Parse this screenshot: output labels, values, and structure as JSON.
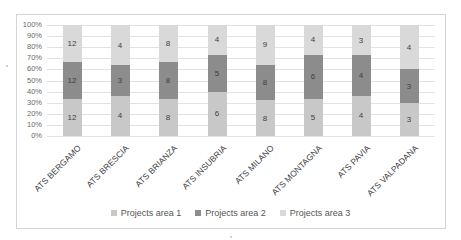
{
  "chart_data": {
    "type": "bar",
    "subtype": "stacked_percent",
    "title": "",
    "xlabel": "",
    "ylabel": "",
    "ylim": [
      0,
      100
    ],
    "y_ticks": [
      "0%",
      "10%",
      "20%",
      "30%",
      "40%",
      "50%",
      "60%",
      "70%",
      "80%",
      "90%",
      "100%"
    ],
    "grid": true,
    "legend_position": "bottom",
    "categories": [
      "ATS BERGAMO",
      "ATS BRESCIA",
      "ATS BRIANZA",
      "ATS INSUBRIA",
      "ATS MILANO",
      "ATS MONTAGNA",
      "ATS PAVIA",
      "ATS VALPADANA"
    ],
    "series": [
      {
        "name": "Projects area 1",
        "color": "#c8c8c8",
        "values": [
          12,
          4,
          8,
          6,
          8,
          5,
          4,
          3
        ]
      },
      {
        "name": "Projects area 2",
        "color": "#8c8c8c",
        "values": [
          12,
          3,
          8,
          5,
          8,
          6,
          4,
          3
        ]
      },
      {
        "name": "Projects area 3",
        "color": "#d9d9d9",
        "values": [
          12,
          4,
          8,
          4,
          9,
          4,
          3,
          4
        ]
      }
    ]
  }
}
